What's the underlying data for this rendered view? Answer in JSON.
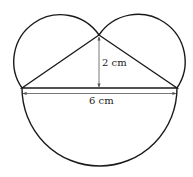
{
  "diagram": {
    "labels": {
      "height": "2 cm",
      "base": "6 cm"
    },
    "colors": {
      "stroke": "#1a1a1a",
      "dimension": "#555555",
      "background": "#ffffff"
    },
    "shapes": {
      "triangle": {
        "apex": [
          99,
          35
        ],
        "left": [
          22,
          88
        ],
        "right": [
          177,
          88
        ]
      },
      "left_circle": {
        "cx": 60.5,
        "cy": 61.5,
        "r": 46.7
      },
      "right_circle": {
        "cx": 138,
        "cy": 61.5,
        "r": 46.7
      },
      "bottom_semicircle": {
        "cx": 99.5,
        "cy": 88,
        "r": 78
      }
    }
  }
}
